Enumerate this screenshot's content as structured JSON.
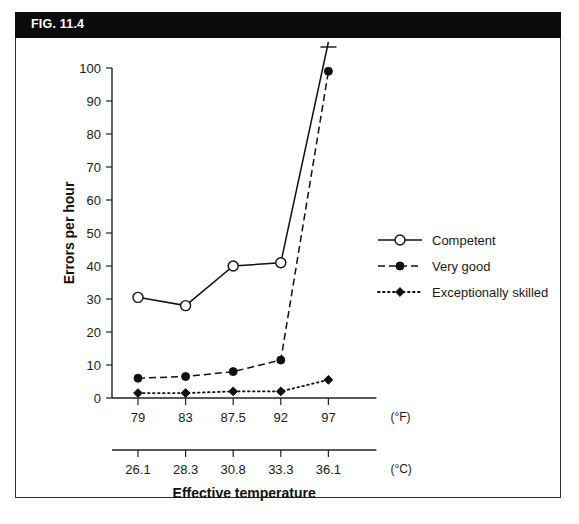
{
  "figure": {
    "banner_label": "FIG. 11.4"
  },
  "chart_data": {
    "type": "line",
    "title": "",
    "xlabel": "Effective temperature",
    "ylabel": "Errors per hour",
    "ylim": [
      0,
      100
    ],
    "ytick_values": [
      0,
      10,
      20,
      30,
      40,
      50,
      60,
      70,
      80,
      90,
      100
    ],
    "ytick_labels": [
      "0",
      "10",
      "20",
      "30",
      "40",
      "50",
      "60",
      "70",
      "80",
      "90",
      "100"
    ],
    "grid": false,
    "legend_position": "right",
    "x_axes": [
      {
        "unit_label": "(°F)",
        "categories": [
          "79",
          "83",
          "87.5",
          "92",
          "97"
        ]
      },
      {
        "unit_label": "(°C)",
        "categories": [
          "26.1",
          "28.3",
          "30.8",
          "33.3",
          "36.1"
        ]
      }
    ],
    "categories": [
      "79",
      "83",
      "87.5",
      "92",
      "97"
    ],
    "series": [
      {
        "name": "Competent",
        "line_style": "solid",
        "marker": "open-circle",
        "values": [
          30.5,
          28,
          40,
          41,
          112
        ],
        "last_point_offscale": true,
        "offscale_note": "axis-break mark above 100"
      },
      {
        "name": "Very good",
        "line_style": "dashed",
        "marker": "filled-circle",
        "values": [
          6,
          6.5,
          8,
          11.5,
          99
        ]
      },
      {
        "name": "Exceptionally skilled",
        "line_style": "dotted",
        "marker": "filled-diamond",
        "values": [
          1.5,
          1.5,
          2,
          2,
          5.5
        ]
      }
    ]
  },
  "legend": {
    "items": [
      {
        "label": "Competent"
      },
      {
        "label": "Very good"
      },
      {
        "label": "Exceptionally skilled"
      }
    ]
  },
  "colors": {
    "banner_background": "#0b0b0b",
    "banner_text": "#ffffff",
    "ink": "#111111",
    "frame": "#2b2b2b",
    "page_background": "#ffffff"
  }
}
